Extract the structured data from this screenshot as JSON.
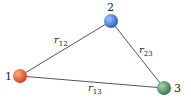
{
  "diagram": {
    "nodes": [
      {
        "id": "1",
        "label": "1",
        "x": 20,
        "y": 76,
        "color": "#e2522e"
      },
      {
        "id": "2",
        "label": "2",
        "x": 111,
        "y": 21,
        "color": "#3a7fd6"
      },
      {
        "id": "3",
        "label": "3",
        "x": 164,
        "y": 88,
        "color": "#4a8a5a"
      }
    ],
    "edges": [
      {
        "from": "1",
        "to": "2",
        "label": "r",
        "sub": "12"
      },
      {
        "from": "2",
        "to": "3",
        "label": "r",
        "sub": "23"
      },
      {
        "from": "1",
        "to": "3",
        "label": "r",
        "sub": "13"
      }
    ]
  }
}
